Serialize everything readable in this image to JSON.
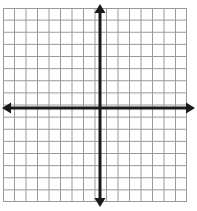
{
  "figure": {
    "type": "cartesian-grid",
    "background_color": "#ffffff"
  },
  "grid": {
    "columns": 16,
    "rows": 16,
    "cell_width": 11.5,
    "cell_height": 11.5,
    "left": 3,
    "top": 8,
    "right": 187,
    "bottom": 202,
    "line_color": "#9a9a9a",
    "line_width": 1,
    "border_color": "#9a9a9a",
    "border_width": 1
  },
  "axes": {
    "color": "#1a1a1a",
    "line_width": 3,
    "origin_x": 100,
    "origin_y": 108,
    "x_axis": {
      "name": "x-axis",
      "start_x": 2,
      "end_x": 195,
      "y": 108,
      "arrow_left": true,
      "arrow_right": true
    },
    "y_axis": {
      "name": "y-axis",
      "x": 100,
      "start_y": 4,
      "end_y": 207,
      "arrow_up": true,
      "arrow_down": true
    },
    "arrow_head_length": 9,
    "arrow_head_width": 11
  },
  "labels": {
    "x_axis_label": "",
    "y_axis_label": "",
    "tick_labels": [],
    "annotations": []
  },
  "chart_data": {
    "type": "scatter",
    "title": "",
    "xlabel": "",
    "ylabel": "",
    "xlim": [
      -8,
      8
    ],
    "ylim": [
      -8,
      8
    ],
    "xticks": [
      -8,
      -7,
      -6,
      -5,
      -4,
      -3,
      -2,
      -1,
      0,
      1,
      2,
      3,
      4,
      5,
      6,
      7,
      8
    ],
    "yticks": [
      -8,
      -7,
      -6,
      -5,
      -4,
      -3,
      -2,
      -1,
      0,
      1,
      2,
      3,
      4,
      5,
      6,
      7,
      8
    ],
    "tick_labels_shown": false,
    "grid": true,
    "legend": null,
    "series": []
  }
}
